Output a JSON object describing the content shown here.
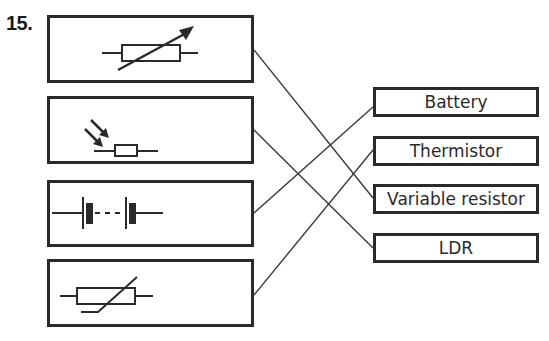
{
  "question": {
    "number": "15."
  },
  "symbols": [
    {
      "id": "variable-resistor-symbol",
      "description": "Variable resistor circuit symbol"
    },
    {
      "id": "ldr-symbol",
      "description": "LDR circuit symbol (resistor with two incoming arrows)"
    },
    {
      "id": "battery-symbol",
      "description": "Battery circuit symbol (cells joined by dashed line)"
    },
    {
      "id": "thermistor-symbol",
      "description": "Thermistor circuit symbol"
    }
  ],
  "labels": [
    {
      "text": "Battery"
    },
    {
      "text": "Thermistor"
    },
    {
      "text": "Variable resistor"
    },
    {
      "text": "LDR"
    }
  ],
  "connections": [
    {
      "from": "variable-resistor-symbol",
      "to": "Variable resistor"
    },
    {
      "from": "ldr-symbol",
      "to": "LDR"
    },
    {
      "from": "battery-symbol",
      "to": "Battery"
    },
    {
      "from": "thermistor-symbol",
      "to": "Thermistor"
    }
  ],
  "colors": {
    "ink": "#2a2a2a",
    "background": "#ffffff"
  }
}
